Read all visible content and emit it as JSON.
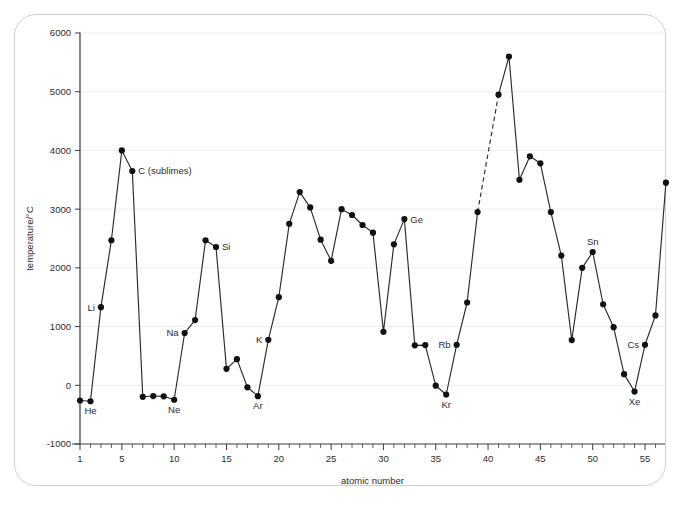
{
  "chart_data": {
    "type": "line",
    "title": "",
    "xlabel": "atomic number",
    "ylabel": "temperature/°C",
    "xlim": [
      0.4,
      57.6
    ],
    "ylim": [
      -1000,
      6000
    ],
    "grid": true,
    "legend": "none",
    "y_ticks": [
      -1000,
      0,
      1000,
      2000,
      3000,
      4000,
      5000,
      6000
    ],
    "y_tick_labels": [
      "-1000",
      "0",
      "1000",
      "2000",
      "3000",
      "4000",
      "5000",
      "6000"
    ],
    "x_ticks": [
      1,
      5,
      10,
      15,
      20,
      25,
      30,
      35,
      40,
      45,
      50,
      55
    ],
    "x_tick_labels": [
      "1",
      "5",
      "10",
      "15",
      "20",
      "25",
      "30",
      "35",
      "40",
      "45",
      "50",
      "55"
    ],
    "x_minor_tick_step": 1,
    "series": [
      {
        "name": "melting point",
        "x": [
          1,
          2,
          3,
          4,
          5,
          6,
          7,
          8,
          9,
          10,
          11,
          12,
          13,
          14,
          15,
          16,
          17,
          18,
          19,
          20,
          21,
          22,
          23,
          24,
          25,
          26,
          27,
          28,
          29,
          30,
          31,
          32,
          33,
          34,
          35,
          36,
          37,
          38,
          39,
          41,
          42,
          43,
          44,
          45,
          46,
          47,
          48,
          49,
          50,
          51,
          52,
          53,
          54,
          55,
          56,
          57
        ],
        "values": [
          -259,
          -272,
          1330,
          2470,
          4000,
          3650,
          -196,
          -183,
          -188,
          -246,
          890,
          1110,
          2470,
          2355,
          280,
          445,
          -34,
          -186,
          774,
          1500,
          2750,
          3290,
          3030,
          2480,
          2120,
          3000,
          2900,
          2730,
          2600,
          910,
          2400,
          2830,
          680,
          685,
          -7,
          -157,
          690,
          1410,
          2950,
          4950,
          5600,
          3500,
          3900,
          3780,
          2950,
          2210,
          770,
          2000,
          2270,
          1380,
          990,
          190,
          -107,
          690,
          1190,
          3450
        ],
        "note_dashed_segment": {
          "from_x": 39,
          "to_x": 41,
          "comment": "gap over elements 40; dashed connector from 2950 at 39 to 4950 at 41"
        }
      }
    ],
    "point_labels": [
      {
        "x": 2,
        "y": -272,
        "text": "He",
        "pos": "below"
      },
      {
        "x": 3,
        "y": 1330,
        "text": "Li",
        "pos": "left"
      },
      {
        "x": 10,
        "y": -246,
        "text": "Ne",
        "pos": "below"
      },
      {
        "x": 11,
        "y": 890,
        "text": "Na",
        "pos": "left"
      },
      {
        "x": 14,
        "y": 2355,
        "text": "Si",
        "pos": "right"
      },
      {
        "x": 6,
        "y": 3650,
        "text": "C (sublimes)",
        "pos": "right"
      },
      {
        "x": 18,
        "y": -186,
        "text": "Ar",
        "pos": "below"
      },
      {
        "x": 19,
        "y": 774,
        "text": "K",
        "pos": "left"
      },
      {
        "x": 32,
        "y": 2830,
        "text": "Ge",
        "pos": "right"
      },
      {
        "x": 36,
        "y": -157,
        "text": "Kr",
        "pos": "below"
      },
      {
        "x": 37,
        "y": 690,
        "text": "Rb",
        "pos": "left"
      },
      {
        "x": 50,
        "y": 2270,
        "text": "Sn",
        "pos": "above"
      },
      {
        "x": 54,
        "y": -107,
        "text": "Xe",
        "pos": "below"
      },
      {
        "x": 55,
        "y": 690,
        "text": "Cs",
        "pos": "left"
      }
    ],
    "colors": {
      "line": "#2a2a2a",
      "point": "#111111",
      "grid": "#ececec",
      "axis": "#3a3a3a",
      "text": "#2b2b2b",
      "frame": "#cfcfcf",
      "background": "#ffffff"
    }
  }
}
